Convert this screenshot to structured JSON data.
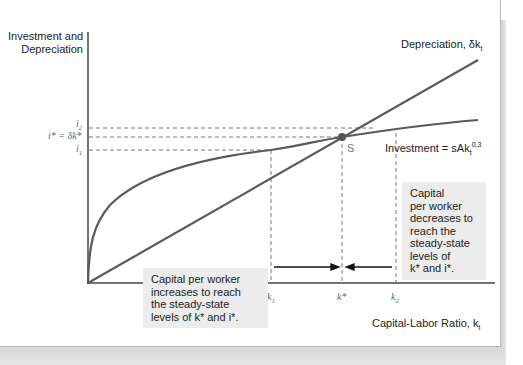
{
  "figure": {
    "y_axis_label_line1": "Investment and",
    "y_axis_label_line2": "Depreciation",
    "x_axis_label": "Capital-Labor Ratio, k",
    "x_axis_label_sub": "t",
    "depreciation_label": "Depreciation, δk",
    "depreciation_label_sub": "t",
    "investment_label": "Investment = sAk",
    "investment_label_sub": "t",
    "investment_label_sup": "0.3",
    "steady_state_label": "S",
    "y_ticks": {
      "i2": "i",
      "i2_sub": "2",
      "istar": "i* = δk*",
      "i1": "i",
      "i1_sub": "1"
    },
    "x_ticks": {
      "k1": "k",
      "k1_sub": "1",
      "kstar": "k*",
      "k2": "k",
      "k2_sub": "2"
    },
    "note_left": [
      "Capital per worker",
      "increases to reach",
      "the steady-state",
      "levels of k* and i*."
    ],
    "note_right": [
      "Capital",
      "per worker",
      "decreases to",
      "reach the",
      "steady-state",
      "levels of",
      "k* and i*."
    ]
  },
  "colors": {
    "curve": "#5a5a5a",
    "axis": "#444444",
    "dashed": "#666666",
    "note_bg": "#ececec",
    "point": "#555555"
  }
}
